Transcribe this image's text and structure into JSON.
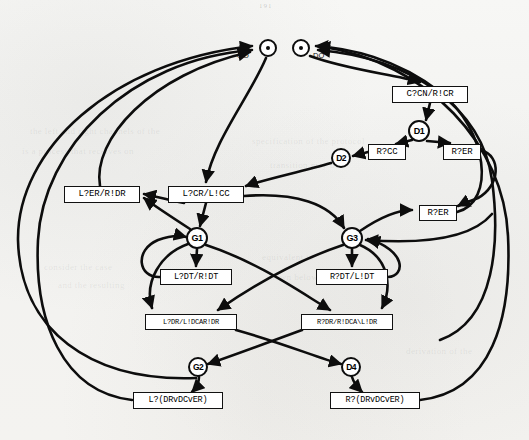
{
  "page": {
    "number": "191",
    "background_color": "#f4f4f2",
    "ink_color": "#0d0d0d"
  },
  "diagram": {
    "type": "state-transition-graph",
    "title": "",
    "entry_ports": [
      {
        "id": "GO",
        "label": "GO",
        "shape": "dot-circle",
        "x": 268,
        "y": 48,
        "r": 9
      },
      {
        "id": "DO",
        "label": "DO",
        "shape": "dot-circle",
        "x": 301,
        "y": 48,
        "r": 9
      }
    ],
    "state_nodes": [
      {
        "id": "D1",
        "label": "D1",
        "x": 419,
        "y": 131,
        "r": 11
      },
      {
        "id": "D2",
        "label": "D2",
        "x": 341,
        "y": 158,
        "r": 10
      },
      {
        "id": "G1",
        "label": "G1",
        "x": 197,
        "y": 238,
        "r": 11
      },
      {
        "id": "G3",
        "label": "G3",
        "x": 352,
        "y": 238,
        "r": 11
      },
      {
        "id": "G2",
        "label": "G2",
        "x": 198,
        "y": 367,
        "r": 10
      },
      {
        "id": "D4",
        "label": "D4",
        "x": 351,
        "y": 367,
        "r": 10
      }
    ],
    "transition_boxes": [
      {
        "id": "box-ccn",
        "label": "C?CN/R!CR",
        "x": 392,
        "y": 86,
        "w": 76,
        "h": 17,
        "font_size": 9
      },
      {
        "id": "box-rcc",
        "label": "R?CC",
        "x": 368,
        "y": 144,
        "w": 38,
        "h": 16,
        "font_size": 9
      },
      {
        "id": "box-rer-top",
        "label": "R?ER",
        "x": 443,
        "y": 144,
        "w": 38,
        "h": 16,
        "font_size": 9
      },
      {
        "id": "box-ler-rdr",
        "label": "L?ER/R!DR",
        "x": 64,
        "y": 186,
        "w": 76,
        "h": 17,
        "font_size": 9
      },
      {
        "id": "box-lcr-lcc",
        "label": "L?CR/L!CC",
        "x": 168,
        "y": 186,
        "w": 76,
        "h": 17,
        "font_size": 9
      },
      {
        "id": "box-rer-mid",
        "label": "R?ER",
        "x": 419,
        "y": 205,
        "w": 38,
        "h": 16,
        "font_size": 9
      },
      {
        "id": "box-ldt",
        "label": "L?DT/R!DT",
        "x": 160,
        "y": 269,
        "w": 72,
        "h": 16,
        "font_size": 8.5
      },
      {
        "id": "box-rdt",
        "label": "R?DT/L!DT",
        "x": 316,
        "y": 269,
        "w": 72,
        "h": 16,
        "font_size": 8.5
      },
      {
        "id": "box-ldr",
        "label": "L?DR/L!DCAR!DR",
        "x": 145,
        "y": 314,
        "w": 92,
        "h": 16,
        "font_size": 7
      },
      {
        "id": "box-rdr",
        "label": "R?DR/R!DCA\\L!DR",
        "x": 301,
        "y": 314,
        "w": 92,
        "h": 16,
        "font_size": 7
      },
      {
        "id": "box-ldrdcer",
        "label": "L?(DRvDCvER)",
        "x": 133,
        "y": 392,
        "w": 90,
        "h": 17,
        "font_size": 8.5
      },
      {
        "id": "box-rdrdcer",
        "label": "R?(DRvDCvER)",
        "x": 330,
        "y": 392,
        "w": 90,
        "h": 17,
        "font_size": 8.5
      }
    ],
    "ghost_text": [
      {
        "text": "the left and right channels of the",
        "x": 30,
        "y": 126
      },
      {
        "text": "is a process that receives on",
        "x": 22,
        "y": 146
      },
      {
        "text": "specification of the protocol",
        "x": 252,
        "y": 136
      },
      {
        "text": "transition may be",
        "x": 270,
        "y": 160
      },
      {
        "text": "consider the case",
        "x": 44,
        "y": 262
      },
      {
        "text": "and the resulting",
        "x": 58,
        "y": 280
      },
      {
        "text": "equivalent to",
        "x": 262,
        "y": 252
      },
      {
        "text": "shown below",
        "x": 266,
        "y": 272
      },
      {
        "text": "derivation of the",
        "x": 406,
        "y": 346
      },
      {
        "text": "composition",
        "x": 420,
        "y": 200
      }
    ]
  }
}
